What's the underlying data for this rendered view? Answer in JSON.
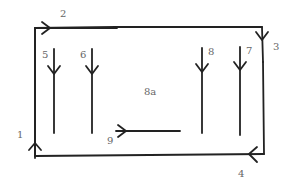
{
  "diagram": {
    "labels": {
      "l1": "1",
      "l2": "2",
      "l3": "3",
      "l4": "4",
      "l5": "5",
      "l6": "6",
      "l7": "7",
      "l8": "8",
      "l9": "9",
      "center": "8a"
    },
    "colors": {
      "stroke": "#222222",
      "label": "#666666"
    }
  }
}
